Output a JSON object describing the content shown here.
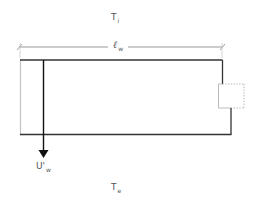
{
  "diagram": {
    "labels": {
      "inside_temp": {
        "main": "T",
        "sub": "i"
      },
      "outside_temp": {
        "main": "T",
        "sub": "e"
      },
      "wall_length": {
        "main": "ℓ",
        "sub": "w"
      },
      "u_value": {
        "main": "U'",
        "sub": "w"
      }
    },
    "colors": {
      "wall_line": "#333333",
      "light_line": "#bbbbbb",
      "dimension_line": "#999999",
      "arrow": "#111111"
    }
  }
}
